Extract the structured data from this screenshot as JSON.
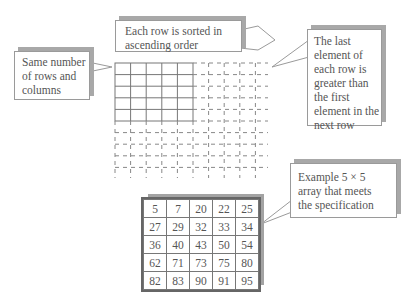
{
  "callouts": {
    "top": "Each row is sorted in\nascending order",
    "left": "Same number\nof rows and\ncolumns",
    "right": "The last\nelement of\neach row is\ngreater than\nthe first\nelement in the\nnext row",
    "bottom": "Example 5 × 5\narray that meets\nthe specification"
  },
  "example_array": {
    "rows": [
      [
        "5",
        "7",
        "20",
        "22",
        "25"
      ],
      [
        "27",
        "29",
        "32",
        "33",
        "34"
      ],
      [
        "36",
        "40",
        "43",
        "50",
        "54"
      ],
      [
        "62",
        "71",
        "73",
        "75",
        "80"
      ],
      [
        "82",
        "83",
        "90",
        "91",
        "95"
      ]
    ]
  },
  "colors": {
    "grid_line": "#777777",
    "shadow": "#a8a8a8",
    "text": "#555555"
  }
}
